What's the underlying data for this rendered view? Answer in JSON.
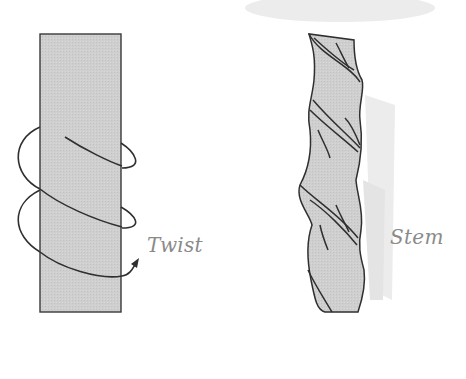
{
  "figure": {
    "panels": [
      {
        "id": "twist",
        "label": "Twist",
        "description": "rectangular bar with helical arrow wrapping around it"
      },
      {
        "id": "stem",
        "label": "Stem",
        "description": "plant stem with spiraling twisted fibers"
      }
    ]
  },
  "colors": {
    "fill": "#cfcfcf",
    "stroke": "#2f2f2f",
    "label": "#8a8a8a",
    "smudge": "#e8e8e8"
  }
}
